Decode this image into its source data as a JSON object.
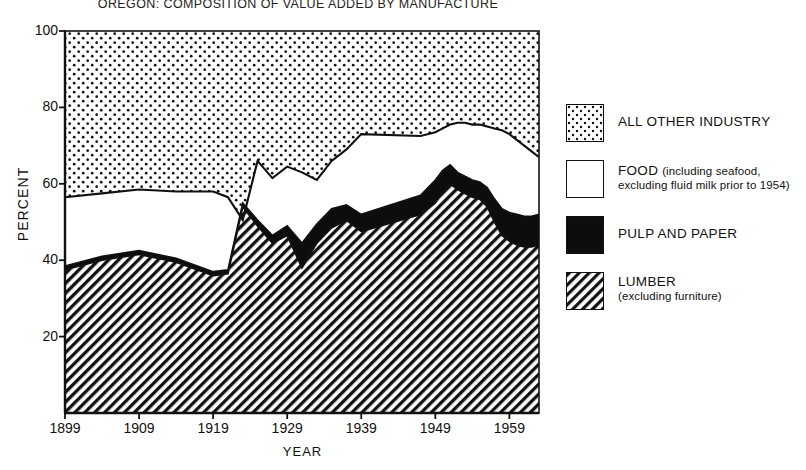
{
  "title": "OREGON: COMPOSITION OF VALUE ADDED BY MANUFACTURE",
  "axes": {
    "ylabel": "PERCENT",
    "xlabel": "YEAR",
    "yticks": [
      "20",
      "40",
      "60",
      "80",
      "100"
    ],
    "xticks": [
      "1899",
      "1909",
      "1919",
      "1929",
      "1939",
      "1949",
      "1959"
    ]
  },
  "legend": [
    {
      "key": "all-other-industry",
      "pattern": "dotted",
      "main": "ALL OTHER  INDUSTRY",
      "sub": ""
    },
    {
      "key": "food",
      "pattern": "white",
      "main": "FOOD",
      "sub": "(including seafood,",
      "sub2": "excluding fluid milk prior to 1954)"
    },
    {
      "key": "pulp-and-paper",
      "pattern": "solid-black",
      "main": "PULP  AND  PAPER",
      "sub": ""
    },
    {
      "key": "lumber",
      "pattern": "hatched",
      "main": "LUMBER",
      "sub": "(excluding furniture)"
    }
  ],
  "colors": {
    "ink": "#111111",
    "paper": "#ffffff",
    "pulp_fill": "#0d0d0d"
  },
  "chart_data": {
    "type": "area",
    "title": "OREGON: COMPOSITION OF VALUE ADDED BY MANUFACTURE",
    "xlabel": "YEAR",
    "ylabel": "PERCENT",
    "xlim": [
      1899,
      1963
    ],
    "ylim": [
      0,
      100
    ],
    "grid": false,
    "legend_position": "right",
    "stacked": true,
    "note": "Stacked composition; values are cumulative tops read off the y-axis. Remainder to 100 is ALL OTHER INDUSTRY.",
    "x": [
      1899,
      1904,
      1909,
      1914,
      1919,
      1921,
      1923,
      1925,
      1927,
      1929,
      1931,
      1933,
      1935,
      1937,
      1939,
      1947,
      1949,
      1950,
      1951,
      1952,
      1953,
      1954,
      1955,
      1956,
      1957,
      1958,
      1959,
      1960,
      1961,
      1962,
      1963
    ],
    "series": [
      {
        "name": "LUMBER (excluding furniture)",
        "pattern": "hatched",
        "values": [
          37.5,
          40.0,
          41.5,
          39.5,
          36.0,
          36.5,
          54.0,
          49.0,
          44.5,
          46.5,
          38.0,
          44.5,
          48.5,
          50.5,
          47.5,
          52.0,
          55.0,
          58.0,
          60.0,
          58.5,
          57.5,
          56.5,
          56.0,
          54.0,
          50.0,
          46.5,
          45.0,
          44.0,
          43.5,
          43.5,
          44.0
        ]
      },
      {
        "name": "PULP AND PAPER",
        "pattern": "solid-black",
        "cumulative_top": [
          38.5,
          41.0,
          42.5,
          40.5,
          37.0,
          37.5,
          55.0,
          50.5,
          46.5,
          49.0,
          44.5,
          49.5,
          53.5,
          54.5,
          52.0,
          57.0,
          61.0,
          63.5,
          65.0,
          63.0,
          62.0,
          61.0,
          60.5,
          59.0,
          56.0,
          53.5,
          52.5,
          52.0,
          51.5,
          51.5,
          52.0
        ]
      },
      {
        "name": "FOOD (including seafood, excluding fluid milk prior to 1954)",
        "pattern": "white",
        "cumulative_top": [
          56.5,
          57.5,
          58.5,
          58.0,
          58.0,
          56.5,
          50.5,
          66.0,
          61.5,
          64.5,
          63.0,
          61.0,
          66.0,
          69.0,
          73.0,
          72.5,
          73.5,
          74.5,
          75.5,
          76.0,
          76.0,
          75.5,
          75.5,
          75.0,
          74.5,
          74.0,
          73.0,
          71.5,
          70.0,
          68.5,
          67.0
        ]
      },
      {
        "name": "ALL OTHER INDUSTRY",
        "pattern": "dotted",
        "cumulative_top": [
          100,
          100,
          100,
          100,
          100,
          100,
          100,
          100,
          100,
          100,
          100,
          100,
          100,
          100,
          100,
          100,
          100,
          100,
          100,
          100,
          100,
          100,
          100,
          100,
          100,
          100,
          100,
          100,
          100,
          100,
          100
        ]
      }
    ]
  }
}
